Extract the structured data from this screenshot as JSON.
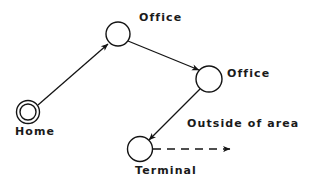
{
  "diagram": {
    "stroke_color": "#141414",
    "background_color": "#ffffff",
    "nodes": [
      {
        "id": "home",
        "label": "Home",
        "shape": "double-circle",
        "cx": 28,
        "cy": 112,
        "r_outer": 12,
        "r_inner": 8.5,
        "label_x": 15,
        "label_y": 126
      },
      {
        "id": "office-1",
        "label": "Office",
        "shape": "circle",
        "cx": 118,
        "cy": 34,
        "r_outer": 12,
        "label_x": 139,
        "label_y": 12
      },
      {
        "id": "office-2",
        "label": "Office",
        "shape": "circle",
        "cx": 209,
        "cy": 79,
        "r_outer": 13,
        "label_x": 227,
        "label_y": 68
      },
      {
        "id": "terminal",
        "label": "Terminal",
        "shape": "circle",
        "cx": 140,
        "cy": 149,
        "r_outer": 12.5,
        "label_x": 135,
        "label_y": 165
      }
    ],
    "edges": [
      {
        "id": "home-to-office-1",
        "from": "home",
        "to": "office-1",
        "style": "solid",
        "arrow": "end",
        "x1": 38,
        "y1": 105,
        "x2": 108,
        "y2": 44
      },
      {
        "id": "office-1-to-office-2",
        "from": "office-1",
        "to": "office-2",
        "style": "solid",
        "arrow": "end",
        "x1": 128,
        "y1": 41,
        "x2": 199,
        "y2": 70
      },
      {
        "id": "office-2-to-terminal",
        "from": "office-2",
        "to": "terminal",
        "style": "solid",
        "arrow": "end",
        "x1": 200,
        "y1": 89,
        "x2": 149,
        "y2": 140
      },
      {
        "id": "terminal-to-outside",
        "from": "terminal",
        "to": "outside-of-area",
        "style": "dashed",
        "arrow": "end",
        "label": "Outside of area",
        "x1": 153,
        "y1": 149,
        "x2": 232,
        "y2": 149,
        "label_x": 187,
        "label_y": 118
      }
    ]
  }
}
